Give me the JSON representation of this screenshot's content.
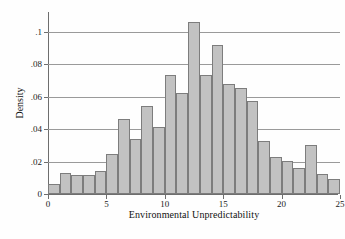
{
  "chart_data": {
    "type": "bar",
    "title": "",
    "subtitle": "",
    "xlabel": "Environmental Unpredictability",
    "ylabel": "Density",
    "xlim": [
      0,
      25
    ],
    "ylim": [
      0,
      0.112
    ],
    "grid": "horizontal",
    "legend": "none",
    "bin_width": 1,
    "bar_fill_color": "#c2c2c2",
    "bar_border_color": "#7d7d7d",
    "gridline_color": "#9a9a9a",
    "axis_color": "#6e6e6e",
    "background_color": "#fefefe",
    "x_ticks": [
      0,
      5,
      10,
      15,
      20,
      25
    ],
    "x_tick_labels": [
      "0",
      "5",
      "10",
      "15",
      "20",
      "25"
    ],
    "y_ticks": [
      0,
      0.02,
      0.04,
      0.06,
      0.08,
      0.1
    ],
    "y_tick_labels": [
      "0",
      ".02",
      ".04",
      ".06",
      ".08",
      ".1"
    ],
    "bins": [
      {
        "x0": 0,
        "x1": 1,
        "value": 0.006
      },
      {
        "x0": 1,
        "x1": 2,
        "value": 0.013
      },
      {
        "x0": 2,
        "x1": 3,
        "value": 0.012
      },
      {
        "x0": 3,
        "x1": 4,
        "value": 0.012
      },
      {
        "x0": 4,
        "x1": 5,
        "value": 0.014
      },
      {
        "x0": 5,
        "x1": 6,
        "value": 0.0245
      },
      {
        "x0": 6,
        "x1": 7,
        "value": 0.046
      },
      {
        "x0": 7,
        "x1": 8,
        "value": 0.034
      },
      {
        "x0": 8,
        "x1": 9,
        "value": 0.054
      },
      {
        "x0": 9,
        "x1": 10,
        "value": 0.041
      },
      {
        "x0": 10,
        "x1": 11,
        "value": 0.073
      },
      {
        "x0": 11,
        "x1": 12,
        "value": 0.062
      },
      {
        "x0": 12,
        "x1": 13,
        "value": 0.106
      },
      {
        "x0": 13,
        "x1": 14,
        "value": 0.073
      },
      {
        "x0": 14,
        "x1": 15,
        "value": 0.092
      },
      {
        "x0": 15,
        "x1": 16,
        "value": 0.0675
      },
      {
        "x0": 16,
        "x1": 17,
        "value": 0.0655
      },
      {
        "x0": 17,
        "x1": 18,
        "value": 0.057
      },
      {
        "x0": 18,
        "x1": 19,
        "value": 0.0325
      },
      {
        "x0": 19,
        "x1": 20,
        "value": 0.0225
      },
      {
        "x0": 20,
        "x1": 21,
        "value": 0.0205
      },
      {
        "x0": 21,
        "x1": 22,
        "value": 0.016
      },
      {
        "x0": 22,
        "x1": 23,
        "value": 0.03
      },
      {
        "x0": 23,
        "x1": 24,
        "value": 0.0125
      },
      {
        "x0": 24,
        "x1": 25,
        "value": 0.009
      }
    ]
  }
}
